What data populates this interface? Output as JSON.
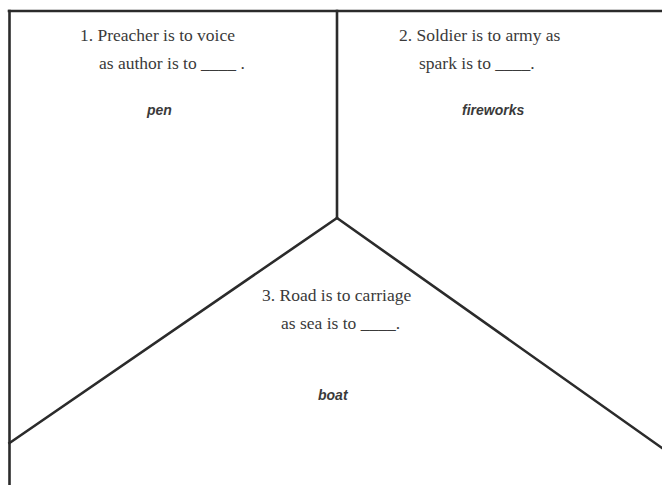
{
  "worksheet": {
    "cells": [
      {
        "number": "1.",
        "prompt_line1": "1. Preacher is to voice",
        "prompt_line2": "as author is to ____ .",
        "answer": "pen"
      },
      {
        "number": "2.",
        "prompt_line1": "2. Soldier is to army as",
        "prompt_line2": "spark is to ____.",
        "answer": "fireworks"
      },
      {
        "number": "3.",
        "prompt_line1": "3. Road is to carriage",
        "prompt_line2": "as sea is to ____.",
        "answer": "boat"
      }
    ],
    "colors": {
      "line": "#2b2b2b",
      "text": "#3a3a3a",
      "background": "#ffffff"
    }
  }
}
